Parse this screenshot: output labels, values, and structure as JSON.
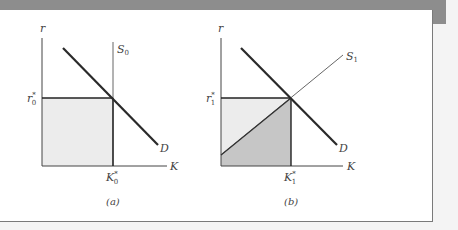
{
  "figure": {
    "panels": [
      {
        "id": "a",
        "caption": "(a)",
        "y_axis_label": "r",
        "x_axis_label": "K",
        "supply_label": "S",
        "supply_subscript": "0",
        "demand_label": "D",
        "r_star_label": "r",
        "r_star_subscript": "0",
        "k_star_label": "K",
        "k_star_subscript": "0",
        "star": "*",
        "supply_type": "vertical (perfectly inelastic)",
        "shaded_regions": [
          "rectangle below r0* up to K0*"
        ]
      },
      {
        "id": "b",
        "caption": "(b)",
        "y_axis_label": "r",
        "x_axis_label": "K",
        "supply_label": "S",
        "supply_subscript": "1",
        "demand_label": "D",
        "r_star_label": "r",
        "r_star_subscript": "1",
        "k_star_label": "K",
        "k_star_subscript": "1",
        "star": "*",
        "supply_type": "upward sloping",
        "shaded_regions": [
          "light triangle above S1 (rent)",
          "dark region below S1 (opportunity cost)"
        ]
      }
    ],
    "colors": {
      "top_bar": "#8d8d8d",
      "light_shade": "#ececec",
      "dark_shade": "#c6c6c6",
      "demand_line": "#2a2a2a",
      "axis_line": "#333333"
    }
  }
}
